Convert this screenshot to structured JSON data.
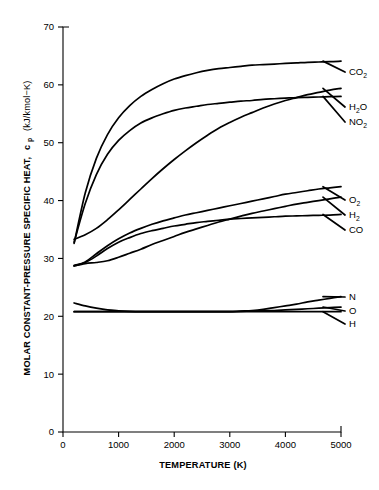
{
  "figure": {
    "background_color": "#ffffff",
    "line_color": "#000000"
  },
  "axis_titles": {
    "x": "TEMPERATURE (K)",
    "y_main": "MOLAR CONSTANT-PRESSURE SPECIFIC HEAT,",
    "y_symbol": "c",
    "y_symbol_sub": "p",
    "y_units": "(kJ/kmol−K)"
  },
  "xticks": [
    {
      "value": 0,
      "label": "0"
    },
    {
      "value": 1000,
      "label": "1000"
    },
    {
      "value": 2000,
      "label": "2000"
    },
    {
      "value": 3000,
      "label": "3000"
    },
    {
      "value": 4000,
      "label": "4000"
    },
    {
      "value": 5000,
      "label": "5000"
    }
  ],
  "yticks": [
    {
      "value": 0,
      "label": "0"
    },
    {
      "value": 10,
      "label": "10"
    },
    {
      "value": 20,
      "label": "20"
    },
    {
      "value": 30,
      "label": "30"
    },
    {
      "value": 40,
      "label": "40"
    },
    {
      "value": 50,
      "label": "50"
    },
    {
      "value": 60,
      "label": "60"
    },
    {
      "value": 70,
      "label": "70"
    }
  ],
  "series_labels": [
    {
      "id": "co2",
      "base": "CO",
      "sub": "2",
      "label": "CO2"
    },
    {
      "id": "h2o",
      "base": "H",
      "sub": "2",
      "tail": "O",
      "label": "H2O"
    },
    {
      "id": "no2",
      "base": "NO",
      "sub": "2",
      "label": "NO2"
    },
    {
      "id": "o2",
      "base": "O",
      "sub": "2",
      "label": "O2"
    },
    {
      "id": "h2",
      "base": "H",
      "sub": "2",
      "label": "H2"
    },
    {
      "id": "co",
      "base": "CO",
      "sub": "",
      "label": "CO"
    },
    {
      "id": "n",
      "base": "N",
      "sub": "",
      "label": "N"
    },
    {
      "id": "o",
      "base": "O",
      "sub": "",
      "label": "O"
    },
    {
      "id": "h",
      "base": "H",
      "sub": "",
      "label": "H"
    }
  ],
  "chart_data": {
    "type": "line",
    "title": "",
    "xlabel": "TEMPERATURE (K)",
    "ylabel": "MOLAR CONSTANT-PRESSURE SPECIFIC HEAT, c̄p (kJ/kmol−K)",
    "xlim": [
      0,
      5000
    ],
    "ylim": [
      0,
      70
    ],
    "grid": false,
    "legend": "inline-right-endpoint-labels",
    "x": [
      200,
      400,
      600,
      800,
      1000,
      1200,
      1400,
      1600,
      1800,
      2000,
      2200,
      2400,
      2600,
      2800,
      3000,
      3200,
      3400,
      3600,
      3800,
      4000,
      4200,
      4400,
      4600,
      4800,
      5000
    ],
    "series": [
      {
        "name": "CO2",
        "values": [
          32.6,
          41.3,
          47.3,
          51.4,
          54.3,
          56.4,
          58.0,
          59.2,
          60.2,
          61.0,
          61.6,
          62.1,
          62.5,
          62.8,
          63.0,
          63.2,
          63.4,
          63.5,
          63.6,
          63.7,
          63.8,
          63.9,
          63.95,
          64.0,
          64.1
        ]
      },
      {
        "name": "H2O",
        "values": [
          33.3,
          34.1,
          35.2,
          36.7,
          38.4,
          40.2,
          42.0,
          43.8,
          45.5,
          47.1,
          48.6,
          50.0,
          51.3,
          52.5,
          53.5,
          54.4,
          55.2,
          56.0,
          56.7,
          57.3,
          57.8,
          58.3,
          58.7,
          59.1,
          59.4
        ]
      },
      {
        "name": "NO2",
        "values": [
          32.8,
          39.5,
          44.5,
          48.0,
          50.4,
          52.1,
          53.4,
          54.3,
          55.0,
          55.6,
          56.0,
          56.3,
          56.6,
          56.8,
          57.0,
          57.2,
          57.3,
          57.5,
          57.6,
          57.7,
          57.8,
          57.85,
          57.9,
          57.95,
          58.0
        ]
      },
      {
        "name": "O2",
        "values": [
          28.8,
          29.4,
          30.8,
          32.2,
          33.4,
          34.4,
          35.2,
          35.9,
          36.5,
          37.0,
          37.5,
          37.9,
          38.3,
          38.7,
          39.1,
          39.5,
          39.9,
          40.3,
          40.7,
          41.1,
          41.4,
          41.7,
          42.0,
          42.2,
          42.4
        ]
      },
      {
        "name": "H2",
        "values": [
          28.7,
          29.1,
          29.3,
          29.6,
          30.2,
          30.9,
          31.6,
          32.4,
          33.1,
          33.8,
          34.5,
          35.1,
          35.7,
          36.3,
          36.8,
          37.3,
          37.8,
          38.2,
          38.6,
          39.0,
          39.4,
          39.7,
          40.0,
          40.3,
          40.6
        ]
      },
      {
        "name": "CO",
        "values": [
          28.7,
          29.3,
          30.4,
          31.7,
          32.8,
          33.6,
          34.3,
          34.8,
          35.2,
          35.6,
          35.9,
          36.2,
          36.4,
          36.6,
          36.8,
          36.9,
          37.0,
          37.1,
          37.2,
          37.3,
          37.35,
          37.4,
          37.45,
          37.5,
          37.6
        ]
      },
      {
        "name": "N",
        "values": [
          20.8,
          20.8,
          20.8,
          20.8,
          20.8,
          20.8,
          20.8,
          20.8,
          20.8,
          20.8,
          20.8,
          20.8,
          20.8,
          20.8,
          20.8,
          20.9,
          21.0,
          21.2,
          21.5,
          21.8,
          22.1,
          22.5,
          22.8,
          23.1,
          23.4
        ]
      },
      {
        "name": "O",
        "values": [
          22.3,
          21.8,
          21.4,
          21.1,
          20.95,
          20.85,
          20.8,
          20.8,
          20.8,
          20.8,
          20.8,
          20.8,
          20.8,
          20.8,
          20.8,
          20.85,
          20.9,
          20.95,
          21.0,
          21.1,
          21.2,
          21.3,
          21.4,
          21.5,
          21.6
        ]
      },
      {
        "name": "H",
        "values": [
          20.8,
          20.8,
          20.8,
          20.8,
          20.8,
          20.8,
          20.8,
          20.8,
          20.8,
          20.8,
          20.8,
          20.8,
          20.8,
          20.8,
          20.8,
          20.8,
          20.8,
          20.8,
          20.8,
          20.8,
          20.8,
          20.8,
          20.8,
          20.8,
          20.8
        ]
      }
    ],
    "label_endpoints": [
      {
        "name": "CO2",
        "y": 64.1
      },
      {
        "name": "H2O",
        "y": 59.4
      },
      {
        "name": "NO2",
        "y": 58.0
      },
      {
        "name": "O2",
        "y": 42.4
      },
      {
        "name": "H2",
        "y": 40.6
      },
      {
        "name": "CO",
        "y": 37.6
      },
      {
        "name": "N",
        "y": 23.4
      },
      {
        "name": "O",
        "y": 21.6
      },
      {
        "name": "H",
        "y": 20.8
      }
    ]
  }
}
